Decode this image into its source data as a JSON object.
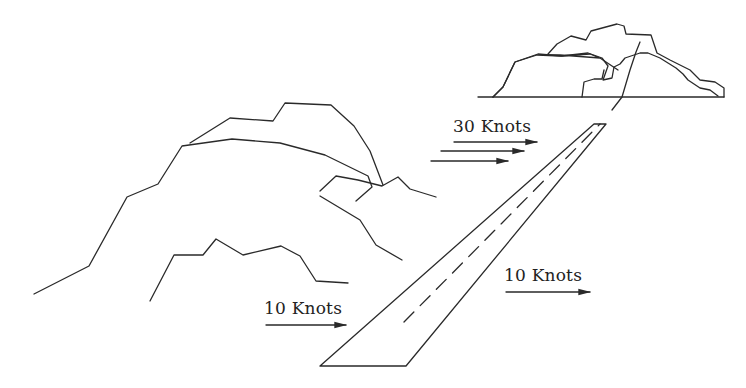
{
  "diagram": {
    "colors": {
      "line": "#2a2a2a",
      "background": "#ffffff",
      "text": "#222222"
    },
    "labels": {
      "upper_wind": "30 Knots",
      "lower_left_wind": "10 Knots",
      "lower_right_wind": "10 Knots"
    },
    "elements": {
      "runway": "runway",
      "mountains": "mountains",
      "distant_hills": "distant-hills",
      "horizon": "horizon-line"
    }
  }
}
